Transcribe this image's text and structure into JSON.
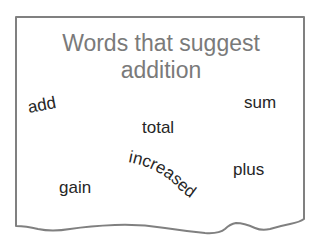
{
  "card": {
    "title_line1": "Words that suggest",
    "title_line2": "addition",
    "border_color": "#808080",
    "title_color": "#7a7a7a",
    "word_color": "#262626"
  },
  "words": {
    "add": "add",
    "sum": "sum",
    "total": "total",
    "plus": "plus",
    "gain": "gain",
    "increased": "increased"
  }
}
